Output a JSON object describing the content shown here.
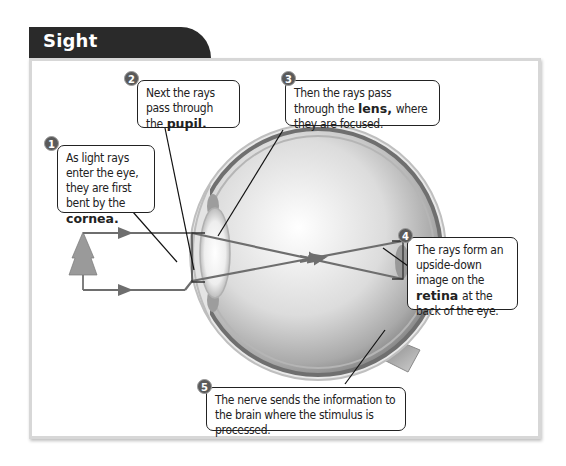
{
  "header": {
    "title": "Sight"
  },
  "colors": {
    "tab_background": "#2a2a2a",
    "badge": "#5a5a5a",
    "ray": "#6e6e6e",
    "panel_border": "#d7d7d7"
  },
  "diagram": {
    "subject": "eye",
    "object_icon": "tree-icon",
    "callouts": [
      {
        "number": "1",
        "text_before": "As light rays enter the eye, they are first bent by the",
        "bold": "cornea.",
        "text_after": ""
      },
      {
        "number": "2",
        "text_before": "Next the rays pass through the",
        "bold": "pupil.",
        "text_after": ""
      },
      {
        "number": "3",
        "text_before": "Then the rays pass through the",
        "bold": "lens,",
        "text_after": "where they are focused."
      },
      {
        "number": "4",
        "text_before": "The rays form an upside-down image on the",
        "bold": "retina",
        "text_after": "at the back of the eye."
      },
      {
        "number": "5",
        "text_before": "The nerve sends the information to the brain where the stimulus is processed.",
        "bold": "",
        "text_after": ""
      }
    ]
  }
}
